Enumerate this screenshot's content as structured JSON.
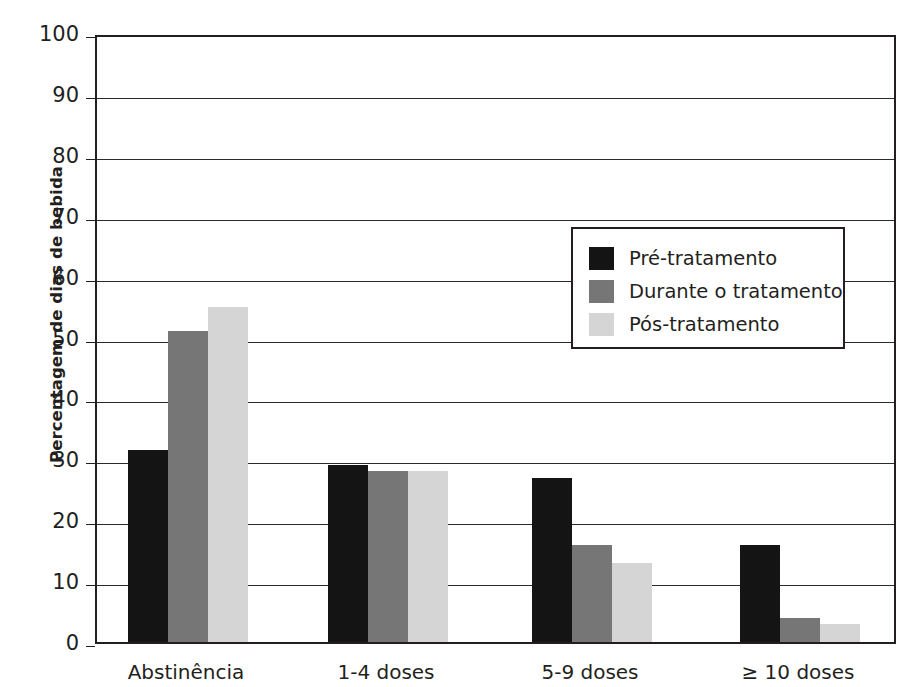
{
  "chart_data": {
    "type": "bar",
    "title": "",
    "subtitle": "",
    "xlabel": "",
    "ylabel": "Percentagem de dias de bebida",
    "ylim": [
      0,
      100
    ],
    "yticks": [
      0,
      10,
      20,
      30,
      40,
      50,
      60,
      70,
      80,
      90,
      100
    ],
    "grid": true,
    "legend_position": "inside-top-center",
    "categories": [
      "Abstinência",
      "1-4 doses",
      "5-9 doses",
      "≥ 10  doses"
    ],
    "series": [
      {
        "name": "Pré-tratamento",
        "color": "#141414",
        "values": [
          31.5,
          29,
          27,
          16
        ]
      },
      {
        "name": "Durante o tratamento",
        "color": "#767676",
        "values": [
          51,
          28,
          16,
          4
        ]
      },
      {
        "name": "Pós-tratamento",
        "color": "#d5d5d5",
        "values": [
          55,
          28,
          13,
          3
        ]
      }
    ],
    "annotations": []
  },
  "axis": {
    "y_title": "Percentagem de dias de bebida",
    "tick_labels": [
      "100",
      "90",
      "80",
      "70",
      "60",
      "50",
      "40",
      "30",
      "20",
      "10",
      "0"
    ]
  },
  "legend": {
    "items": [
      {
        "label": "Pré-tratamento",
        "color": "#141414"
      },
      {
        "label": "Durante o tratamento",
        "color": "#767676"
      },
      {
        "label": "Pós-tratamento",
        "color": "#d5d5d5"
      }
    ]
  },
  "categories": [
    {
      "label": "Abstinência"
    },
    {
      "label": "1-4 doses"
    },
    {
      "label": "5-9 doses"
    },
    {
      "label": "≥ 10  doses"
    }
  ]
}
